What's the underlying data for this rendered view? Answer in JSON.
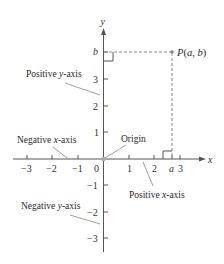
{
  "diagram": {
    "type": "cartesian-coordinate-plane",
    "axes": {
      "x_label": "x",
      "y_label": "y",
      "x_ticks": [
        "−3",
        "−2",
        "−1",
        "0",
        "1",
        "2",
        "3"
      ],
      "y_ticks": [
        "3",
        "2",
        "1",
        "−1",
        "−2",
        "−3"
      ],
      "x_special": "a",
      "y_special": "b"
    },
    "point": {
      "label": "P(a, b)",
      "label_parts": {
        "P": "P",
        "open": "(",
        "a": "a",
        "comma": ", ",
        "b": "b",
        "close": ")"
      }
    },
    "annotations": {
      "positive_y": {
        "text": "Positive ",
        "var": "y",
        "suffix": "-axis"
      },
      "negative_x": {
        "text": "Negative ",
        "var": "x",
        "suffix": "-axis"
      },
      "origin": "Origin",
      "positive_x": {
        "text": "Positive ",
        "var": "x",
        "suffix": "-axis"
      },
      "negative_y": {
        "text": "Negative ",
        "var": "y",
        "suffix": "-axis"
      }
    },
    "colors": {
      "axis": "#555555",
      "dashed": "#888888",
      "leader": "#777777",
      "point": "#888888",
      "origin_dot": "#aaaaaa"
    }
  }
}
